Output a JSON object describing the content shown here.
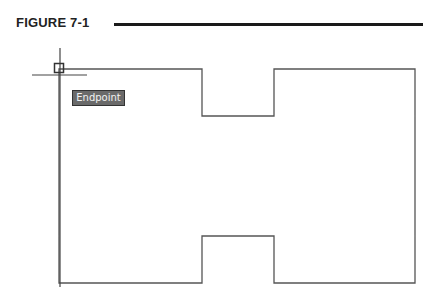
{
  "figure": {
    "label": "FIGURE 7-1"
  },
  "drawing": {
    "shape": "H-shaped closed polyline",
    "outline_color": "#555555",
    "points": [
      [
        59,
        69
      ],
      [
        202,
        69
      ],
      [
        202,
        116
      ],
      [
        274,
        116
      ],
      [
        274,
        69
      ],
      [
        415,
        69
      ],
      [
        415,
        283
      ],
      [
        274,
        283
      ],
      [
        274,
        236
      ],
      [
        202,
        236
      ],
      [
        202,
        283
      ],
      [
        59,
        283
      ]
    ]
  },
  "cursor": {
    "crosshair_x": 60,
    "crosshair_y": 75,
    "snap_marker": "endpoint-square"
  },
  "tooltip": {
    "text": "Endpoint"
  }
}
